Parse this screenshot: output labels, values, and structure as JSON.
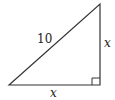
{
  "diagram": {
    "type": "right-triangle",
    "hypotenuse_label": "10",
    "vertical_leg_label": "x",
    "horizontal_leg_label": "x",
    "right_angle_marker": true,
    "stroke_color": "#333333"
  }
}
